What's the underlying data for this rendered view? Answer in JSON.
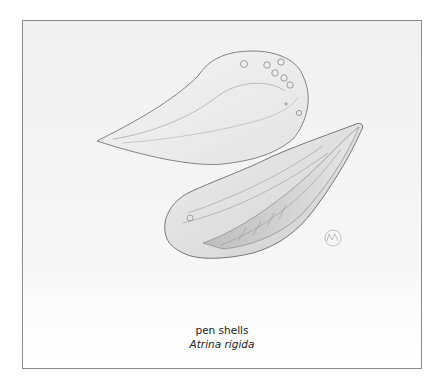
{
  "illustration": {
    "subject": "pen-shells-drawing",
    "style": "pencil sketch",
    "signature": "artist-monogram"
  },
  "caption": {
    "common_name": "pen shells",
    "scientific_name": "Atrina rigida"
  },
  "colors": {
    "frame_border": "#8a8a8a",
    "paper": "#f3f3f3",
    "text": "#222222",
    "pencil": "#6e6e6e"
  }
}
